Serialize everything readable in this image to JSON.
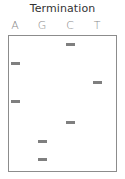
{
  "title": "Termination",
  "lanes": [
    {
      "label": "A",
      "x": 15
    },
    {
      "label": "G",
      "x": 42
    },
    {
      "label": "C",
      "x": 70
    },
    {
      "label": "T",
      "x": 97
    }
  ],
  "band_color": "#7f7f7f",
  "bands": [
    {
      "lane": "C",
      "x": 66,
      "y": 43
    },
    {
      "lane": "A",
      "x": 11,
      "y": 62
    },
    {
      "lane": "T",
      "x": 93,
      "y": 81
    },
    {
      "lane": "A",
      "x": 11,
      "y": 100
    },
    {
      "lane": "C",
      "x": 66,
      "y": 121
    },
    {
      "lane": "G",
      "x": 38,
      "y": 140
    },
    {
      "lane": "G",
      "x": 38,
      "y": 158
    }
  ],
  "sequence_read_bottom_to_top": [
    "G",
    "G",
    "C",
    "A",
    "T",
    "A",
    "C"
  ]
}
